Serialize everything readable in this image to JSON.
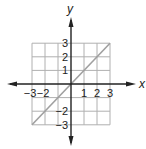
{
  "axes": {
    "x_label": "x",
    "y_label": "y",
    "x_ticks": [
      {
        "v": -3,
        "label": "−3"
      },
      {
        "v": -2,
        "label": "−2"
      },
      {
        "v": 1,
        "label": "1"
      },
      {
        "v": 2,
        "label": "2"
      },
      {
        "v": 3,
        "label": "3"
      }
    ],
    "y_ticks": [
      {
        "v": 3,
        "label": "3"
      },
      {
        "v": 2,
        "label": "2"
      },
      {
        "v": 1,
        "label": "1"
      },
      {
        "v": -2,
        "label": "−2"
      },
      {
        "v": -3,
        "label": "−3"
      }
    ],
    "range": [
      -3,
      3
    ]
  },
  "line": {
    "equation": "y = x",
    "from": [
      -3,
      -3
    ],
    "to": [
      3,
      3
    ],
    "color": "#a0a0a0"
  },
  "colors": {
    "grid": "#b0b0b0",
    "axis": "#222222"
  }
}
